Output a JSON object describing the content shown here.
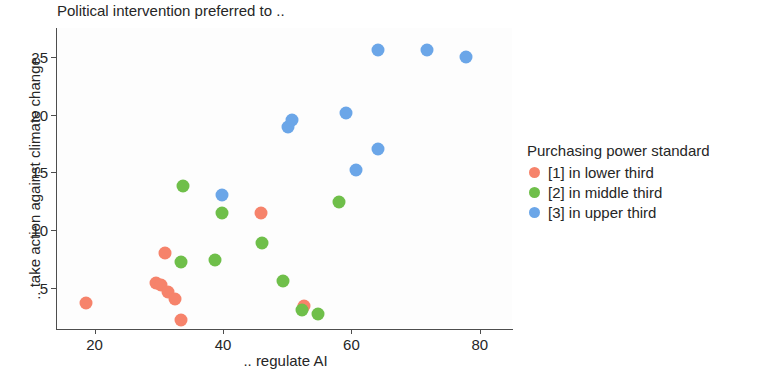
{
  "chart_data": {
    "type": "scatter",
    "title": "Political intervention preferred to ..",
    "xlabel": ".. regulate AI",
    "ylabel": ".. take action against climate change",
    "xlim": [
      14,
      85
    ],
    "ylim": [
      1.5,
      27.5
    ],
    "xticks": [
      20,
      40,
      60,
      80
    ],
    "yticks": [
      5,
      10,
      15,
      20,
      25
    ],
    "grid": false,
    "legend_position": "right",
    "legend_title": "Purchasing power standard",
    "series": [
      {
        "name": "[1] in lower third",
        "color": "#F6836B",
        "points": [
          {
            "x": 18.7,
            "y": 3.7
          },
          {
            "x": 29.5,
            "y": 5.4
          },
          {
            "x": 30.3,
            "y": 5.2
          },
          {
            "x": 31.0,
            "y": 8.0
          },
          {
            "x": 31.4,
            "y": 4.6
          },
          {
            "x": 32.5,
            "y": 4.0
          },
          {
            "x": 33.4,
            "y": 2.2
          },
          {
            "x": 45.9,
            "y": 11.5
          },
          {
            "x": 52.6,
            "y": 3.4
          }
        ]
      },
      {
        "name": "[2] in middle third",
        "color": "#6FBF4A",
        "points": [
          {
            "x": 33.4,
            "y": 7.2
          },
          {
            "x": 33.8,
            "y": 13.8
          },
          {
            "x": 38.8,
            "y": 7.4
          },
          {
            "x": 39.8,
            "y": 11.5
          },
          {
            "x": 46.1,
            "y": 8.9
          },
          {
            "x": 49.4,
            "y": 5.6
          },
          {
            "x": 52.3,
            "y": 3.1
          },
          {
            "x": 54.8,
            "y": 2.7
          },
          {
            "x": 58.0,
            "y": 12.4
          }
        ]
      },
      {
        "name": "[3] in upper third",
        "color": "#6BA6E8",
        "points": [
          {
            "x": 39.9,
            "y": 13.0
          },
          {
            "x": 50.1,
            "y": 18.9
          },
          {
            "x": 50.7,
            "y": 19.5
          },
          {
            "x": 59.2,
            "y": 20.1
          },
          {
            "x": 60.7,
            "y": 15.2
          },
          {
            "x": 64.1,
            "y": 17.0
          },
          {
            "x": 64.1,
            "y": 25.6
          },
          {
            "x": 71.8,
            "y": 25.6
          },
          {
            "x": 77.9,
            "y": 25.0
          }
        ]
      }
    ]
  }
}
